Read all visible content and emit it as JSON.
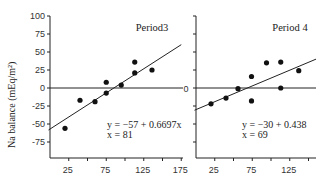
{
  "ylabel": "Na balance (mEq/m²)",
  "chart_data": [
    {
      "type": "scatter",
      "title": "Period3",
      "xlabel": "",
      "ylabel": "Na balance (mEq/m²)",
      "xlim": [
        0,
        175
      ],
      "ylim": [
        -100,
        100
      ],
      "x_ticks": [
        "25",
        "75",
        "125",
        "175"
      ],
      "y_ticks": [
        "100",
        "75",
        "50",
        "25",
        "0",
        "-25",
        "-50",
        "-75"
      ],
      "points": [
        [
          20,
          -56
        ],
        [
          40,
          -17
        ],
        [
          60,
          -19
        ],
        [
          75,
          8
        ],
        [
          75,
          -7
        ],
        [
          95,
          4
        ],
        [
          113,
          36
        ],
        [
          113,
          21
        ],
        [
          136,
          25
        ]
      ],
      "regression": {
        "intercept": -57,
        "slope": 0.6697
      },
      "annotation": [
        "y = −57 + 0.6697x",
        "x =    81"
      ]
    },
    {
      "type": "scatter",
      "title": "Period 4",
      "xlabel": "",
      "xlim": [
        0,
        160
      ],
      "ylim": [
        -100,
        100
      ],
      "x_ticks": [
        "25",
        "75",
        "125"
      ],
      "y_ticks": [
        "0"
      ],
      "points": [
        [
          20,
          -22
        ],
        [
          40,
          -14
        ],
        [
          56,
          -1
        ],
        [
          74,
          16
        ],
        [
          74,
          -18
        ],
        [
          94,
          35
        ],
        [
          113,
          36
        ],
        [
          113,
          0
        ],
        [
          137,
          24
        ]
      ],
      "regression": {
        "intercept": -30,
        "slope": 0.438
      },
      "annotation": [
        "y = −30 + 0.438",
        "x =    69"
      ]
    }
  ]
}
